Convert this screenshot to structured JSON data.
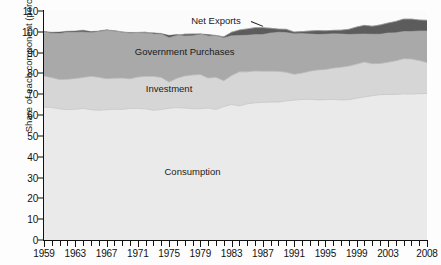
{
  "chart_data": {
    "type": "area",
    "stacked": true,
    "title": "",
    "xlabel": "",
    "ylabel": "Share of each component (percent)",
    "ylim": [
      0,
      110
    ],
    "ytick_values": [
      0,
      10,
      20,
      30,
      40,
      50,
      60,
      70,
      80,
      90,
      100,
      110
    ],
    "xlim": [
      1959,
      2008
    ],
    "xtick_labels": [
      "1959",
      "1963",
      "1967",
      "1971",
      "1975",
      "1979",
      "1983",
      "1987",
      "1991",
      "1995",
      "1999",
      "2003",
      "2008"
    ],
    "xtick_label_years": [
      1959,
      1963,
      1967,
      1971,
      1975,
      1979,
      1983,
      1987,
      1991,
      1995,
      1999,
      2003,
      2008
    ],
    "minor_tick_interval_years": 1,
    "grid": false,
    "legend_position": "in-plot-labels",
    "colors": {
      "consumption": "#eaeaea",
      "investment": "#d6d6d6",
      "government": "#a9a9a9",
      "net_exports": "#5c5c5c",
      "axis": "#111111",
      "plot_background": "#fbfbfb"
    },
    "annotations": [
      {
        "name": "net-exports-label",
        "text": "Net Exports",
        "x_year": 1981,
        "y_value": 105.5,
        "leader_line": true
      },
      {
        "name": "government-purchases-label",
        "text": "Government Purchases",
        "x_year": 1977,
        "y_value": 91
      },
      {
        "name": "investment-label",
        "text": "Investment",
        "x_year": 1975,
        "y_value": 73
      },
      {
        "name": "consumption-label",
        "text": "Consumption",
        "x_year": 1978,
        "y_value": 33
      }
    ],
    "x": [
      1959,
      1960,
      1961,
      1962,
      1963,
      1964,
      1965,
      1966,
      1967,
      1968,
      1969,
      1970,
      1971,
      1972,
      1973,
      1974,
      1975,
      1976,
      1977,
      1978,
      1979,
      1980,
      1981,
      1982,
      1983,
      1984,
      1985,
      1986,
      1987,
      1988,
      1989,
      1990,
      1991,
      1992,
      1993,
      1994,
      1995,
      1996,
      1997,
      1998,
      1999,
      2000,
      2001,
      2002,
      2003,
      2004,
      2005,
      2006,
      2007,
      2008
    ],
    "series": [
      {
        "name": "Consumption",
        "stack_order": 1,
        "values": [
          63.8,
          63.6,
          63.0,
          62.6,
          62.8,
          63.2,
          62.6,
          62.3,
          62.6,
          62.8,
          62.7,
          63.2,
          63.2,
          63.0,
          62.3,
          62.7,
          63.3,
          63.6,
          63.4,
          63.1,
          63.1,
          63.4,
          62.7,
          64.1,
          65.1,
          64.4,
          65.4,
          65.9,
          66.1,
          66.3,
          66.3,
          66.8,
          67.2,
          67.5,
          67.6,
          67.3,
          67.4,
          67.5,
          67.3,
          67.4,
          68.1,
          68.7,
          69.3,
          69.8,
          69.9,
          69.9,
          70.2,
          70.1,
          70.3,
          70.4
        ]
      },
      {
        "name": "Investment",
        "stack_order": 2,
        "values": [
          15.0,
          14.4,
          14.1,
          14.6,
          14.8,
          14.9,
          16.0,
          15.9,
          14.9,
          14.9,
          15.1,
          14.2,
          15.1,
          15.6,
          16.3,
          15.4,
          12.6,
          14.1,
          15.4,
          16.2,
          16.4,
          14.4,
          15.5,
          12.4,
          13.9,
          16.4,
          15.4,
          15.3,
          15.0,
          14.8,
          14.7,
          13.8,
          12.4,
          12.7,
          13.5,
          14.4,
          14.5,
          15.1,
          15.7,
          16.2,
          16.4,
          16.8,
          15.4,
          15.0,
          15.5,
          16.2,
          16.9,
          16.9,
          15.9,
          14.9
        ]
      },
      {
        "name": "Government Purchases",
        "stack_order": 3,
        "values": [
          21.2,
          21.3,
          22.1,
          22.6,
          22.2,
          21.8,
          21.0,
          22.0,
          23.2,
          22.8,
          22.1,
          22.0,
          21.4,
          21.2,
          20.4,
          20.9,
          21.3,
          20.5,
          20.1,
          19.7,
          19.5,
          20.2,
          20.0,
          21.1,
          20.8,
          20.1,
          20.6,
          20.8,
          20.9,
          20.6,
          20.3,
          20.6,
          20.3,
          19.9,
          19.3,
          18.9,
          18.6,
          18.1,
          17.8,
          17.6,
          17.8,
          17.6,
          18.0,
          18.5,
          18.8,
          18.9,
          19.0,
          19.1,
          19.5,
          20.2
        ]
      },
      {
        "name": "Net Exports",
        "stack_order": 4,
        "values": [
          0.2,
          0.5,
          0.7,
          0.5,
          0.6,
          0.9,
          0.5,
          0.2,
          0.3,
          0.0,
          0.0,
          0.3,
          0.0,
          -0.3,
          0.5,
          0.2,
          1.1,
          0.5,
          -0.7,
          -0.7,
          0.0,
          0.7,
          0.1,
          -0.3,
          -1.4,
          -2.4,
          -2.8,
          -3.1,
          -3.1,
          -2.0,
          -1.3,
          -1.3,
          -0.6,
          -0.7,
          -1.2,
          -1.6,
          -1.4,
          -1.4,
          -1.6,
          -2.2,
          -3.2,
          -3.9,
          -3.6,
          -4.2,
          -4.5,
          -5.2,
          -5.7,
          -5.7,
          -5.1,
          -4.9
        ]
      }
    ]
  }
}
